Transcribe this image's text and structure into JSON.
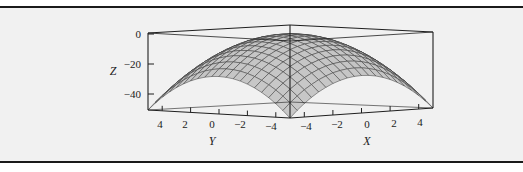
{
  "chart_data": {
    "type": "surface3d",
    "title": "",
    "function": "z = -(x^2 + y^2)",
    "x": {
      "label": "X",
      "ticks": [
        -4,
        -2,
        0,
        2,
        4
      ],
      "range": [
        -5,
        5
      ]
    },
    "y": {
      "label": "Y",
      "ticks": [
        4,
        2,
        0,
        -2,
        -4
      ],
      "range": [
        -5,
        5
      ]
    },
    "z": {
      "label": "Z",
      "ticks": [
        0,
        -20,
        -40
      ],
      "range": [
        -50,
        0
      ]
    },
    "mesh": {
      "rows": 20,
      "cols": 20,
      "fill": "#c8c8c8",
      "line": "#3a3a3a"
    },
    "grid": false,
    "legend": null,
    "samples": [
      {
        "x": 0,
        "y": 0,
        "z": 0
      },
      {
        "x": 5,
        "y": 0,
        "z": -25
      },
      {
        "x": 0,
        "y": 5,
        "z": -25
      },
      {
        "x": 5,
        "y": 5,
        "z": -50
      },
      {
        "x": -5,
        "y": -5,
        "z": -50
      }
    ]
  },
  "labels": {
    "z_title": "Z",
    "y_title": "Y",
    "x_title": "X",
    "z_ticks": [
      "0",
      "−20",
      "−40"
    ],
    "y_ticks": [
      "4",
      "2",
      "0",
      "−2",
      "−4"
    ],
    "x_ticks": [
      "−4",
      "−2",
      "0",
      "2",
      "4"
    ]
  }
}
